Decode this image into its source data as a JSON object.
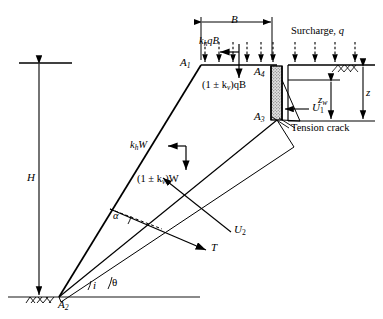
{
  "diagram": {
    "type": "engineering-diagram"
  },
  "labels": {
    "point_a1": "A",
    "point_a1_sub": "1",
    "point_a2": "A",
    "point_a2_sub": "2",
    "point_a3": "A",
    "point_a3_sub": "3",
    "point_a4": "A",
    "point_a4_sub": "4",
    "dim_B": "B",
    "dim_H": "H",
    "dim_z": "z",
    "dim_zw": "z",
    "dim_zw_sub": "w",
    "force_khqB": "k",
    "force_khqB_sub": "h",
    "force_khqB_rest": "qB",
    "force_kvqB": "(1 ± k",
    "force_kvqB_sub": "v",
    "force_kvqB_rest": ")qB",
    "force_khW": "k",
    "force_khW_sub": "h",
    "force_khW_rest": "W",
    "force_kvW": "(1 ± k",
    "force_kvW_sub": "v",
    "force_kvW_rest": ")W",
    "force_U1": "U",
    "force_U1_sub": "1",
    "force_U2": "U",
    "force_U2_sub": "2",
    "force_T": "T",
    "surcharge": "Surcharge, ",
    "surcharge_sym": "q",
    "tension_crack": "Tension crack",
    "angle_alpha": "α",
    "angle_theta": "θ",
    "angle_i": "i"
  },
  "colors": {
    "line": "#000000",
    "ground": "#808080",
    "crack_fill": "#d9d9d9",
    "background": "#ffffff"
  },
  "geometry": {
    "A1": [
      201,
      65
    ],
    "A2": [
      59,
      297
    ],
    "A3": [
      277,
      120
    ],
    "A4": [
      277,
      66
    ],
    "ground_y": 297,
    "crest_y": 65,
    "crack_top_y": 66,
    "crack_bottom_y": 120,
    "water_table_y": 80,
    "B_left_x": 201,
    "B_right_x": 272,
    "B_dim_y": 22,
    "H_dim_x": 39,
    "H_top_y": 63,
    "H_bottom_y": 296,
    "z_dim_x": 363,
    "zw_dim_x": 331
  }
}
